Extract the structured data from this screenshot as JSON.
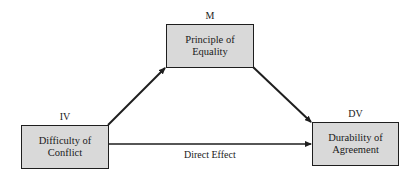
{
  "diagram": {
    "type": "mediation-model",
    "nodes": {
      "iv": {
        "role_label": "IV",
        "text": "Difficulty of Conflict",
        "line1": "Difficulty of",
        "line2": "Conflict"
      },
      "m": {
        "role_label": "M",
        "text": "Principle of Equality"
      },
      "dv": {
        "role_label": "DV",
        "text": "Durability of Agreement",
        "line1": "Durability of",
        "line2": "Agreement"
      }
    },
    "edges": [
      {
        "from": "iv",
        "to": "m",
        "label": ""
      },
      {
        "from": "m",
        "to": "dv",
        "label": ""
      },
      {
        "from": "iv",
        "to": "dv",
        "label": "Direct Effect"
      }
    ],
    "direct_effect_label": "Direct Effect",
    "colors": {
      "box_fill": "#d9d9d9",
      "stroke": "#1e1e1e",
      "background": "#ffffff"
    }
  }
}
